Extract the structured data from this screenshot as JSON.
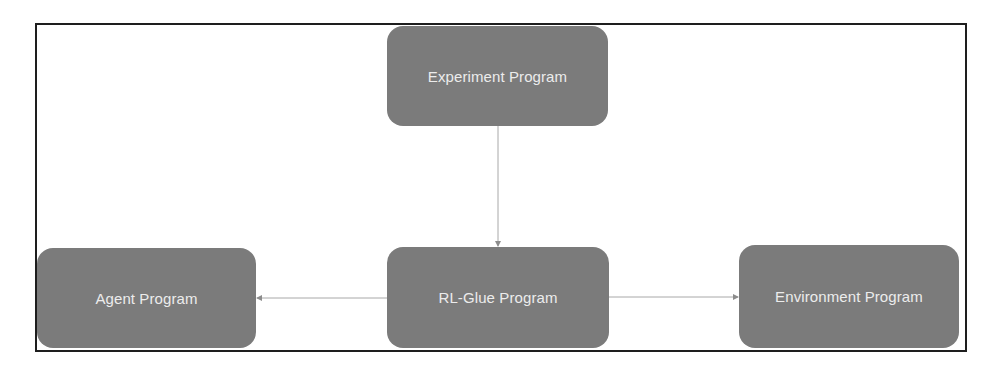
{
  "diagram": {
    "type": "flow",
    "frame": {
      "border_color": "#1e1e1e"
    },
    "colors": {
      "node_fill": "#7b7b7b",
      "node_text": "#ececec",
      "connector": "#a8a8a8"
    },
    "nodes": [
      {
        "id": "experiment",
        "label": "Experiment Program"
      },
      {
        "id": "rlglue",
        "label": "RL-Glue Program"
      },
      {
        "id": "agent",
        "label": "Agent Program"
      },
      {
        "id": "environment",
        "label": "Environment Program"
      }
    ],
    "edges": [
      {
        "from": "experiment",
        "to": "rlglue",
        "direction": "down"
      },
      {
        "from": "rlglue",
        "to": "agent",
        "direction": "left"
      },
      {
        "from": "rlglue",
        "to": "environment",
        "direction": "right"
      }
    ]
  }
}
